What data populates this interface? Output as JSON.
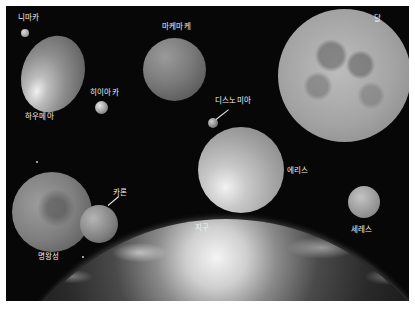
{
  "figure": {
    "background": "#070707",
    "border_color": "#ffffff",
    "bodies": [
      {
        "id": "namaka",
        "label": "니마카"
      },
      {
        "id": "haumea",
        "label": "하우메아"
      },
      {
        "id": "hiiaka",
        "label": "히이아카"
      },
      {
        "id": "makemake",
        "label": "마케마케"
      },
      {
        "id": "moon",
        "label": "달"
      },
      {
        "id": "dysnomia",
        "label": "디스노미아"
      },
      {
        "id": "eris",
        "label": "에리스"
      },
      {
        "id": "ceres",
        "label": "세레스"
      },
      {
        "id": "pluto",
        "label": "명왕성"
      },
      {
        "id": "charon",
        "label": "카론"
      },
      {
        "id": "earth",
        "label": "지구"
      }
    ]
  }
}
